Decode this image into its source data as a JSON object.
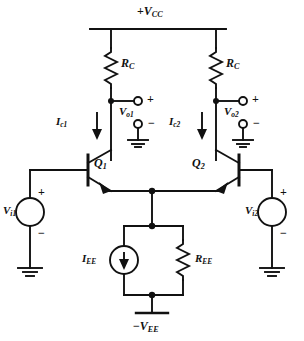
{
  "diagram": {
    "type": "schematic",
    "line_color": "#111111",
    "background": "#ffffff"
  },
  "rails": {
    "supply_positive": {
      "prefix": "+",
      "symbol": "V",
      "sub": "CC"
    },
    "supply_negative": {
      "prefix": "−",
      "symbol": "V",
      "sub": "EE"
    }
  },
  "components": {
    "rc_left": {
      "symbol": "R",
      "sub": "C",
      "kind": "resistor"
    },
    "rc_right": {
      "symbol": "R",
      "sub": "C",
      "kind": "resistor"
    },
    "ree": {
      "symbol": "R",
      "sub": "EE",
      "kind": "resistor"
    },
    "iee": {
      "symbol": "I",
      "sub": "EE",
      "kind": "current-source"
    },
    "q1": {
      "symbol": "Q",
      "sub": "1",
      "kind": "npn-transistor"
    },
    "q2": {
      "symbol": "Q",
      "sub": "2",
      "kind": "npn-transistor"
    },
    "vi1": {
      "symbol": "V",
      "sub": "i1",
      "kind": "voltage-source"
    },
    "vi2": {
      "symbol": "V",
      "sub": "i2",
      "kind": "voltage-source"
    }
  },
  "currents": {
    "ic1": {
      "symbol": "I",
      "sub": "c1",
      "direction": "down"
    },
    "ic2": {
      "symbol": "I",
      "sub": "c2",
      "direction": "down"
    },
    "iee": {
      "symbol": "I",
      "sub": "EE",
      "direction": "down"
    }
  },
  "outputs": {
    "vo1": {
      "symbol": "V",
      "sub": "o1",
      "plus": "+",
      "minus": "−"
    },
    "vo2": {
      "symbol": "V",
      "sub": "o2",
      "plus": "+",
      "minus": "−"
    }
  },
  "inputs": {
    "vi1": {
      "symbol": "V",
      "sub": "i1",
      "plus": "+",
      "minus": "−"
    },
    "vi2": {
      "symbol": "V",
      "sub": "i2",
      "plus": "+",
      "minus": "−"
    }
  },
  "polarity": {
    "plus": "+",
    "minus": "−"
  }
}
